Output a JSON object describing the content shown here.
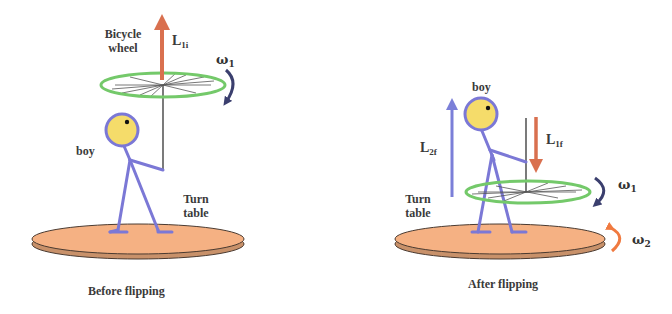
{
  "figure": {
    "panels": [
      {
        "id": "before",
        "caption": "Before flipping",
        "labels": {
          "wheel_line1": "Bicycle",
          "wheel_line2": "wheel",
          "boy": "boy",
          "turntable_line1": "Turn",
          "turntable_line2": "table"
        },
        "vectors": [
          {
            "symbol": "L",
            "subscript": "1i",
            "direction": "up",
            "color": "#d9704f"
          }
        ],
        "rotations": [
          {
            "symbol": "ω",
            "subscript": "1",
            "color": "#3b3f6e"
          }
        ]
      },
      {
        "id": "after",
        "caption": "After flipping",
        "labels": {
          "boy": "boy",
          "turntable_line1": "Turn",
          "turntable_line2": "table"
        },
        "vectors": [
          {
            "symbol": "L",
            "subscript": "2f",
            "direction": "up",
            "color": "#7b7fd8"
          },
          {
            "symbol": "L",
            "subscript": "1f",
            "direction": "down",
            "color": "#d9704f"
          }
        ],
        "rotations": [
          {
            "symbol": "ω",
            "subscript": "1",
            "color": "#3b3f6e"
          },
          {
            "symbol": "ω",
            "subscript": "2",
            "color": "#f07a40"
          }
        ]
      }
    ],
    "colors": {
      "wheel_rim": "#74c96a",
      "spokes": "#555555",
      "boy_body": "#7b78d6",
      "boy_head": "#f5dc6a",
      "turntable_top": "#f5b183",
      "turntable_edge": "#c8916a",
      "outline": "#4a3a30"
    }
  }
}
